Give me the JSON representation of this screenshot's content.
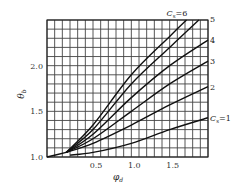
{
  "chart_data": {
    "type": "line",
    "title": "",
    "xlabel": "φd",
    "ylabel": "θb",
    "xlim": [
      -0.1,
      2.0
    ],
    "ylim": [
      1.0,
      2.5
    ],
    "grid": true,
    "grid_step": {
      "x": 0.1,
      "y": 0.1
    },
    "x_ticks": [
      {
        "value": 0.5,
        "label": "0.5"
      },
      {
        "value": 1.0,
        "label": "1.0"
      },
      {
        "value": 1.5,
        "label": "1.5"
      }
    ],
    "y_ticks": [
      {
        "value": 1.0,
        "label": "1.0"
      },
      {
        "value": 1.5,
        "label": "1.5"
      },
      {
        "value": 2.0,
        "label": "2.0"
      }
    ],
    "legend": "inline labels at curve ends",
    "shared_start": [
      [
        -0.1,
        1.0
      ],
      [
        0.15,
        1.05
      ]
    ],
    "series": [
      {
        "name": "Cs=1",
        "label": "Cs=1",
        "points": [
          [
            0.2,
            1.02
          ],
          [
            0.5,
            1.05
          ],
          [
            1.0,
            1.15
          ],
          [
            1.5,
            1.3
          ],
          [
            2.0,
            1.43
          ]
        ]
      },
      {
        "name": "Cs=2",
        "label": "2",
        "points": [
          [
            0.15,
            1.04
          ],
          [
            0.5,
            1.15
          ],
          [
            1.0,
            1.35
          ],
          [
            1.5,
            1.57
          ],
          [
            2.0,
            1.77
          ]
        ]
      },
      {
        "name": "Cs=3",
        "label": "3",
        "points": [
          [
            0.15,
            1.05
          ],
          [
            0.5,
            1.2
          ],
          [
            1.0,
            1.5
          ],
          [
            1.5,
            1.8
          ],
          [
            2.0,
            2.05
          ]
        ]
      },
      {
        "name": "Cs=4",
        "label": "4",
        "points": [
          [
            0.15,
            1.06
          ],
          [
            0.5,
            1.25
          ],
          [
            1.0,
            1.65
          ],
          [
            1.5,
            2.0
          ],
          [
            2.0,
            2.28
          ]
        ]
      },
      {
        "name": "Cs=5",
        "label": "5",
        "points": [
          [
            0.15,
            1.07
          ],
          [
            0.5,
            1.3
          ],
          [
            1.0,
            1.8
          ],
          [
            1.5,
            2.2
          ],
          [
            1.88,
            2.5
          ]
        ]
      },
      {
        "name": "Cs=6",
        "label": "Cs=6",
        "points": [
          [
            0.15,
            1.08
          ],
          [
            0.5,
            1.35
          ],
          [
            1.0,
            1.9
          ],
          [
            1.5,
            2.32
          ],
          [
            1.72,
            2.5
          ]
        ]
      }
    ]
  }
}
